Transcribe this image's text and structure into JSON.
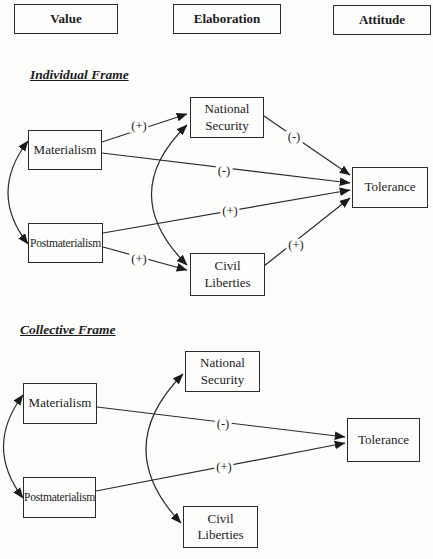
{
  "header": {
    "columns": [
      "Value",
      "Elaboration",
      "Attitude"
    ]
  },
  "individual": {
    "title": "Individual Frame",
    "nodes": {
      "materialism": "Materialism",
      "postmaterialism": "Postmaterialism",
      "national_security": "National Security",
      "civil_liberties": "Civil Liberties",
      "tolerance": "Tolerance"
    },
    "edges": [
      {
        "from": "Materialism",
        "to": "National Security",
        "sign": "(+)",
        "style": "directed"
      },
      {
        "from": "Materialism",
        "to": "Tolerance",
        "sign": "(-)",
        "style": "directed"
      },
      {
        "from": "Postmaterialism",
        "to": "Civil Liberties",
        "sign": "(+)",
        "style": "directed"
      },
      {
        "from": "Postmaterialism",
        "to": "Tolerance",
        "sign": "(+)",
        "style": "directed"
      },
      {
        "from": "National Security",
        "to": "Tolerance",
        "sign": "(-)",
        "style": "directed"
      },
      {
        "from": "Civil Liberties",
        "to": "Tolerance",
        "sign": "(+)",
        "style": "directed"
      },
      {
        "from": "Materialism",
        "to": "Postmaterialism",
        "sign": "",
        "style": "curved-bidirectional"
      },
      {
        "from": "National Security",
        "to": "Civil Liberties",
        "sign": "",
        "style": "curved-bidirectional"
      }
    ]
  },
  "collective": {
    "title": "Collective Frame",
    "nodes": {
      "materialism": "Materialism",
      "postmaterialism": "Postmaterialism",
      "national_security": "National Security",
      "civil_liberties": "Civil Liberties",
      "tolerance": "Tolerance"
    },
    "edges": [
      {
        "from": "Materialism",
        "to": "Tolerance",
        "sign": "(-)",
        "style": "directed"
      },
      {
        "from": "Postmaterialism",
        "to": "Tolerance",
        "sign": "(+)",
        "style": "directed"
      },
      {
        "from": "Materialism",
        "to": "Postmaterialism",
        "sign": "",
        "style": "curved-bidirectional"
      },
      {
        "from": "National Security",
        "to": "Civil Liberties",
        "sign": "",
        "style": "curved-bidirectional"
      }
    ]
  },
  "colors": {
    "ink": "#2b2b2b",
    "background": "#fdfdfc"
  }
}
